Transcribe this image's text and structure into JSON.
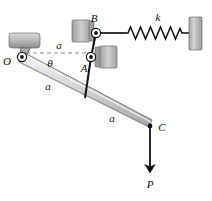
{
  "figure": {
    "type": "mechanism-free-body-diagram",
    "background_color": "#ffffff",
    "line_color": "#111111",
    "bar_fill_light": "#e8e8e8",
    "bar_fill_mid": "#c9c9c9",
    "support_fill": "#b9b9b9",
    "support_fill_dark": "#8f8f8f"
  },
  "labels": {
    "pivot_o": "O",
    "joint_a": "A",
    "joint_b": "B",
    "end_c": "C",
    "spring_stiffness": "k",
    "applied_load": "P",
    "angle_theta": "θ",
    "length_top": "a",
    "length_upper_bar": "a",
    "length_lower_bar": "a"
  },
  "geometry": {
    "point_o": {
      "x": 22,
      "y": 57,
      "name": "O"
    },
    "point_a": {
      "x": 91,
      "y": 57,
      "name": "A"
    },
    "point_b": {
      "x": 96,
      "y": 33,
      "name": "B"
    },
    "point_c": {
      "x": 150,
      "y": 126,
      "name": "C"
    },
    "bar_joint_on_main": {
      "x": 85,
      "y": 97,
      "name": "link-foot"
    },
    "spring_left_x": 124,
    "spring_right_x": 190,
    "spring_y": 33,
    "wall_right_x": 190,
    "force_arrow_tip": {
      "x": 150,
      "y": 170
    }
  },
  "elements": {
    "main_bar": "ground-pivoted-bar-O-to-C",
    "link_AB": "short-link-A-to-B",
    "link_A_to_bar": "connector-A-to-main-bar",
    "spring": "coil-spring-B-to-wall",
    "dashed_reference": "horizontal-dashed-reference-line",
    "force": "downward-force-P-at-C",
    "support_o": "fixed-pin-support-at-O",
    "slider_a": "slider-block-at-A",
    "slider_b": "slider-block-at-B",
    "wall": "fixed-wall-right"
  },
  "spring_coils": 11
}
